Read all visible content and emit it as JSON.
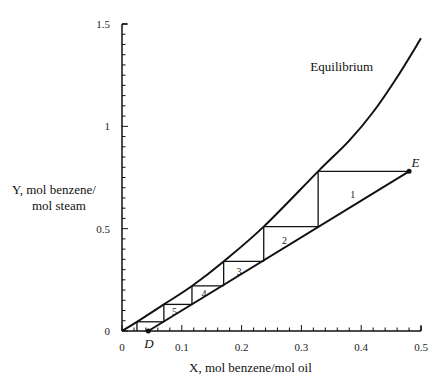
{
  "chart_data": {
    "type": "line",
    "title": "",
    "xlabel": "X, mol benzene/mol oil",
    "ylabel_line1": "Y, mol benzene/",
    "ylabel_line2": "mol steam",
    "xlim": [
      0,
      0.5
    ],
    "ylim": [
      0,
      1.5
    ],
    "grid": false,
    "x_ticks": [
      {
        "value": 0,
        "label": "0"
      },
      {
        "value": 0.1,
        "label": "0.1"
      },
      {
        "value": 0.2,
        "label": "0.2"
      },
      {
        "value": 0.3,
        "label": "0.3"
      },
      {
        "value": 0.4,
        "label": "0.4"
      },
      {
        "value": 0.5,
        "label": "0.5"
      }
    ],
    "y_ticks": [
      {
        "value": 0,
        "label": "0"
      },
      {
        "value": 0.5,
        "label": "0.5"
      },
      {
        "value": 1,
        "label": "1"
      },
      {
        "value": 1.5,
        "label": "1.5"
      }
    ],
    "x_minor_step": 0.02,
    "y_minor_step": 0.05,
    "series": [
      {
        "name": "Equilibrium",
        "x": [
          0,
          0.025,
          0.07,
          0.117,
          0.17,
          0.237,
          0.328,
          0.38,
          0.42,
          0.46,
          0.5
        ],
        "y": [
          0,
          0.045,
          0.13,
          0.22,
          0.34,
          0.51,
          0.78,
          0.93,
          1.07,
          1.24,
          1.43
        ]
      },
      {
        "name": "Operating line",
        "x": [
          0.044,
          0.48
        ],
        "y": [
          0,
          0.78
        ]
      }
    ],
    "stages": [
      {
        "label": "1",
        "x_eq": 0.328,
        "x_op": 0.48,
        "y": 0.78,
        "y_next": 0.51
      },
      {
        "label": "2",
        "x_eq": 0.237,
        "x_op": 0.328,
        "y": 0.51,
        "y_next": 0.34
      },
      {
        "label": "3",
        "x_eq": 0.17,
        "x_op": 0.237,
        "y": 0.34,
        "y_next": 0.22
      },
      {
        "label": "4",
        "x_eq": 0.117,
        "x_op": 0.17,
        "y": 0.22,
        "y_next": 0.13
      },
      {
        "label": "5",
        "x_eq": 0.07,
        "x_op": 0.117,
        "y": 0.13,
        "y_next": 0.045
      },
      {
        "label": "",
        "x_eq": 0.025,
        "x_op": 0.07,
        "y": 0.045,
        "y_next": 0
      }
    ],
    "annotations": [
      {
        "text": "Equilibrium",
        "x": 0.315,
        "y": 1.27
      },
      {
        "text": "E",
        "x": 0.484,
        "y": 0.8,
        "point": [
          0.48,
          0.78
        ]
      },
      {
        "text": "D",
        "x": 0.037,
        "y": -0.085,
        "point": [
          0.044,
          0
        ]
      }
    ],
    "legend": "none"
  }
}
